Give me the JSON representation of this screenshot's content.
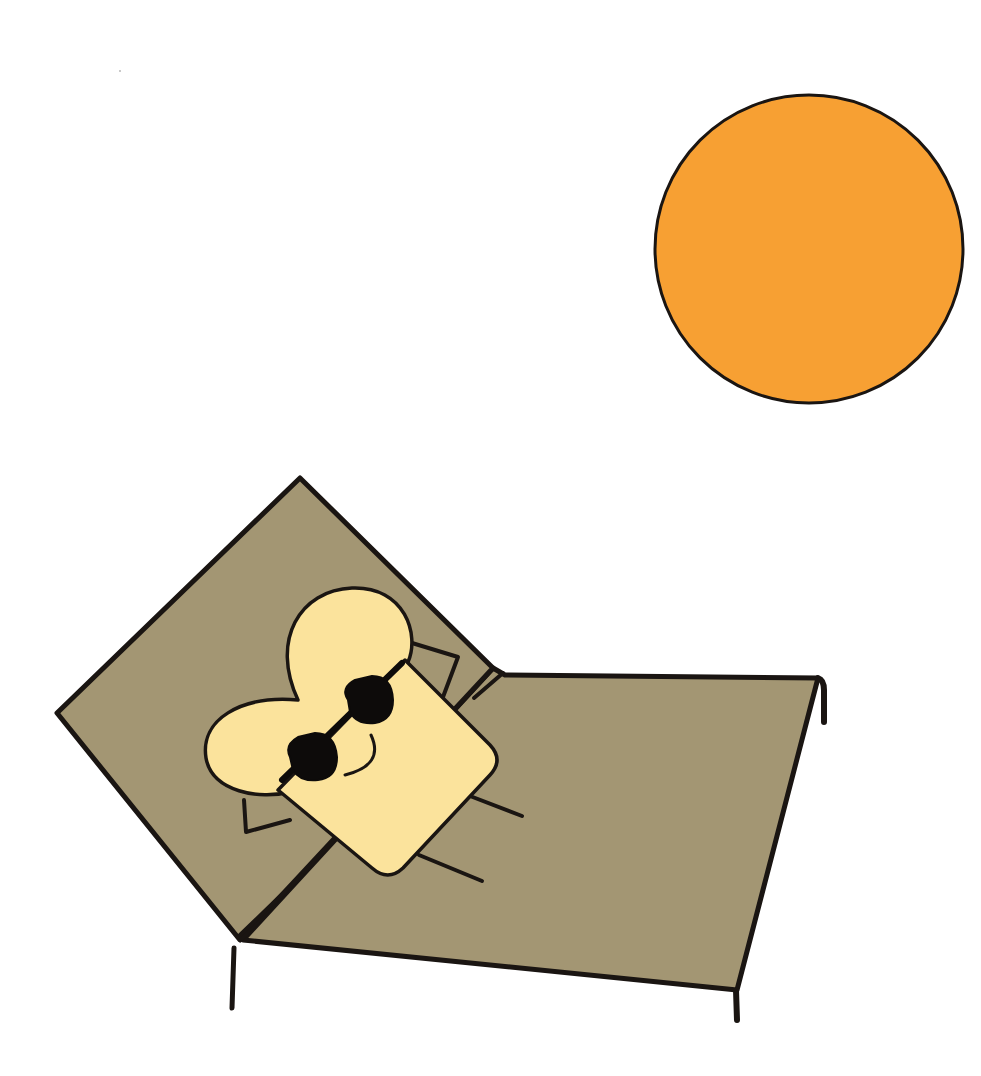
{
  "scene": {
    "title": "Toast sunbathing on a lounge chair",
    "width": 981,
    "height": 1076,
    "background": "#ffffff"
  },
  "colors": {
    "outline": "#1a1512",
    "sun_fill": "#f7a033",
    "chair_fill": "#a39673",
    "toast_fill": "#fbe39c",
    "sunglasses": "#0d0b0a"
  },
  "elements": {
    "sun": {
      "label": "sun",
      "cx": 809,
      "cy": 249,
      "r": 154
    },
    "chair": {
      "label": "lounge-chair"
    },
    "toast": {
      "label": "toast-character",
      "accessory": "sunglasses",
      "expression": "smile"
    }
  }
}
